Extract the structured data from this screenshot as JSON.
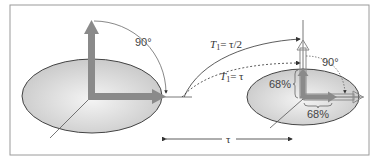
{
  "diagram": {
    "left_state": {
      "angle_label": "90°"
    },
    "right_state": {
      "angle_label": "90°",
      "vertical_percent": "68%",
      "horizontal_percent": "68%"
    },
    "curves": [
      {
        "label_T": "T",
        "label_sub": "1",
        "label_rest": "= τ/2",
        "style": "solid"
      },
      {
        "label_T": "T",
        "label_sub": "1",
        "label_rest": "= τ",
        "style": "dashed"
      }
    ],
    "time_axis": {
      "label": "τ"
    },
    "colors": {
      "arrow": "#8a8a8a",
      "ellipse_fill_light": "#f2f2f2",
      "ellipse_fill_dark": "#c8c8c8",
      "frame": "#9a9a9a",
      "line": "#555555"
    }
  }
}
